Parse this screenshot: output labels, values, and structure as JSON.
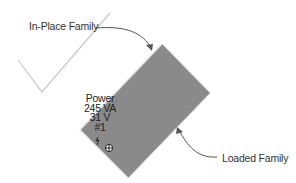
{
  "diagram": {
    "callouts": {
      "in_place": "In-Place Family",
      "loaded": "Loaded Family"
    },
    "tag": {
      "line1": "Power",
      "line2": "245 VA",
      "line3": "31 V",
      "line4": "#1"
    },
    "icons": {
      "move_grip": "move-grip-icon",
      "connector": "electrical-connector-icon"
    },
    "colors": {
      "family_fill": "#8a8a8a",
      "family_edge": "#bdbdbd",
      "line": "#c8c8c8",
      "arrow": "#555555",
      "text": "#333333"
    }
  }
}
